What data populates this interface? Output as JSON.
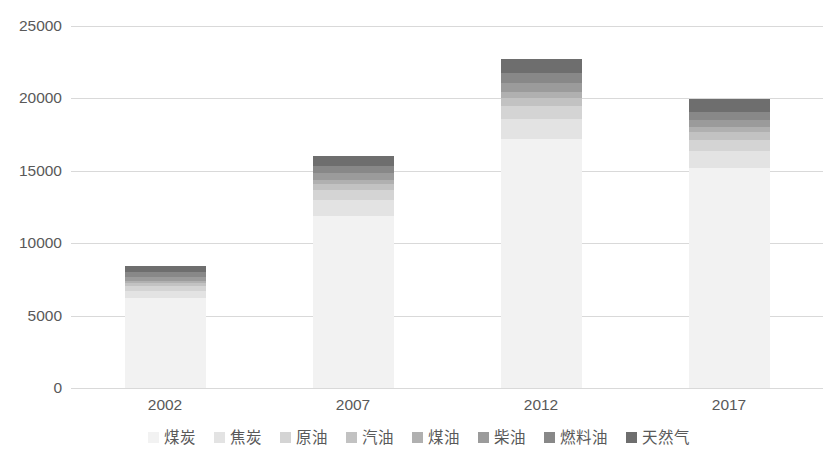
{
  "chart_data": {
    "type": "bar",
    "stacked": true,
    "title": "",
    "subtitle": "",
    "xlabel": "",
    "ylabel": "",
    "categories": [
      "2002",
      "2007",
      "2012",
      "2017"
    ],
    "ylim": [
      0,
      25000
    ],
    "ytick_labels": [
      "0",
      "5000",
      "10000",
      "15000",
      "20000",
      "25000"
    ],
    "ytick_values": [
      0,
      5000,
      10000,
      15000,
      20000,
      25000
    ],
    "grid": true,
    "legend_position": "bottom",
    "series": [
      {
        "name": "煤炭",
        "color": "#f2f2f2",
        "values": [
          6200,
          11900,
          17200,
          15200
        ]
      },
      {
        "name": "焦炭",
        "color": "#e3e3e3",
        "values": [
          500,
          1100,
          1400,
          1200
        ]
      },
      {
        "name": "原油",
        "color": "#d4d4d4",
        "values": [
          350,
          700,
          900,
          750
        ]
      },
      {
        "name": "汽油",
        "color": "#c2c2c2",
        "values": [
          200,
          400,
          550,
          500
        ]
      },
      {
        "name": "煤油",
        "color": "#b0b0b0",
        "values": [
          150,
          300,
          400,
          350
        ]
      },
      {
        "name": "柴油",
        "color": "#9b9b9b",
        "values": [
          250,
          450,
          600,
          520
        ]
      },
      {
        "name": "燃料油",
        "color": "#888888",
        "values": [
          350,
          450,
          700,
          560
        ]
      },
      {
        "name": "天然气",
        "color": "#6e6e6e",
        "values": [
          400,
          700,
          1000,
          900
        ]
      }
    ],
    "totals": [
      8400,
      16000,
      22750,
      19980
    ]
  },
  "axis": {
    "y_ticks": [
      "25000",
      "20000",
      "15000",
      "10000",
      "5000",
      "0"
    ],
    "x_ticks": [
      "2002",
      "2007",
      "2012",
      "2017"
    ]
  },
  "legend": {
    "items": [
      {
        "label": "煤炭"
      },
      {
        "label": "焦炭"
      },
      {
        "label": "原油"
      },
      {
        "label": "汽油"
      },
      {
        "label": "煤油"
      },
      {
        "label": "柴油"
      },
      {
        "label": "燃料油"
      },
      {
        "label": "天然气"
      }
    ]
  },
  "colors": {
    "gridline": "#d9d9d9",
    "text": "#595959",
    "background": "#ffffff"
  }
}
